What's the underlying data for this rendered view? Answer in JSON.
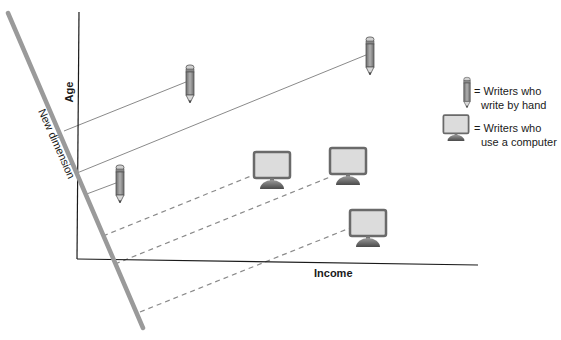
{
  "axes": {
    "y_label": "Age",
    "x_label": "Income",
    "new_dimension_label": "New dimension"
  },
  "legend": {
    "items": [
      {
        "icon": "pencil-icon",
        "line1": "= Writers who",
        "line2": "write by hand"
      },
      {
        "icon": "monitor-icon",
        "line1": "= Writers who",
        "line2": "use a computer"
      }
    ]
  },
  "points": {
    "pencils": [
      {
        "x": 190,
        "y": 70,
        "proj_x": 64,
        "proj_y": 131
      },
      {
        "x": 370,
        "y": 42,
        "proj_x": 77,
        "proj_y": 173
      },
      {
        "x": 120,
        "y": 180,
        "proj_x": 84,
        "proj_y": 195
      }
    ],
    "monitors": [
      {
        "x": 272,
        "y": 170,
        "proj_x": 103,
        "proj_y": 238
      },
      {
        "x": 348,
        "y": 165,
        "proj_x": 112,
        "proj_y": 263
      },
      {
        "x": 368,
        "y": 228,
        "proj_x": 135,
        "proj_y": 312
      }
    ]
  },
  "colors": {
    "axis": "#1a1a1a",
    "new_dimension": "#9a9a9a",
    "projection": "#8a8a8a",
    "monitor_screen": "#dcdcdc",
    "monitor_frame": "#6a6a6a",
    "monitor_base": "#707070",
    "pencil_body": "#8c8c8c"
  }
}
